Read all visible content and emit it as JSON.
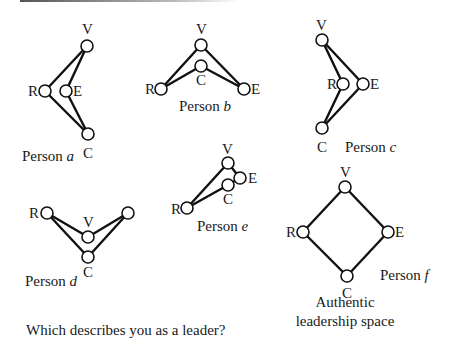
{
  "persons": [
    {
      "id": "a",
      "caption_prefix": "Person",
      "caption_letter": "a",
      "nodes": {
        "V": [
          87,
          46
        ],
        "R": [
          45,
          91
        ],
        "E": [
          66,
          91
        ],
        "C": [
          88,
          134
        ]
      },
      "labels": {
        "V": "V",
        "R": "R",
        "E": "E",
        "C": "C"
      }
    },
    {
      "id": "b",
      "caption_prefix": "Person",
      "caption_letter": "b",
      "nodes": {
        "V": [
          201,
          45
        ],
        "C": [
          201,
          66
        ],
        "R": [
          161,
          89
        ],
        "E": [
          244,
          89
        ]
      },
      "labels": {
        "V": "V",
        "R": "R",
        "E": "E",
        "C": "C"
      }
    },
    {
      "id": "c",
      "caption_prefix": "Person",
      "caption_letter": "c",
      "nodes": {
        "V": [
          322,
          40
        ],
        "R": [
          343,
          84
        ],
        "E": [
          363,
          84
        ],
        "C": [
          322,
          128
        ]
      },
      "labels": {
        "V": "V",
        "R": "R",
        "E": "E",
        "C": "C"
      }
    },
    {
      "id": "d",
      "caption_prefix": "Person",
      "caption_letter": "d",
      "nodes": {
        "R": [
          47,
          213
        ],
        "E": [
          128,
          213
        ],
        "V": [
          88,
          237
        ],
        "C": [
          88,
          257
        ]
      },
      "labels": {
        "V": "V",
        "R": "R",
        "C": "C"
      }
    },
    {
      "id": "e",
      "caption_prefix": "Person",
      "caption_letter": "e",
      "nodes": {
        "V": [
          228,
          163
        ],
        "E": [
          240,
          178
        ],
        "C": [
          228,
          185
        ],
        "R": [
          187,
          208
        ]
      },
      "labels": {
        "V": "V",
        "R": "R",
        "E": "E",
        "C": "C"
      }
    },
    {
      "id": "f",
      "caption_prefix": "Person",
      "caption_letter": "f",
      "nodes": {
        "V": [
          345,
          187
        ],
        "R": [
          303,
          232
        ],
        "E": [
          388,
          232
        ],
        "C": [
          347,
          276
        ]
      },
      "labels": {
        "V": "V",
        "R": "R",
        "E": "E",
        "C": "C"
      }
    }
  ],
  "authentic_label_line1": "Authentic",
  "authentic_label_line2": "leadership space",
  "question": "Which describes you as a leader?",
  "colors": {
    "stroke": "#111111",
    "text": "#1a1a1a",
    "background": "#ffffff"
  }
}
